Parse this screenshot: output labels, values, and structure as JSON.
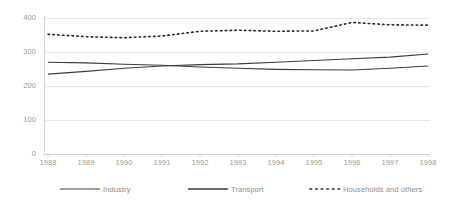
{
  "chart_data": {
    "type": "line",
    "title": "",
    "xlabel": "",
    "ylabel": "",
    "categories": [
      "1988",
      "1989",
      "1990",
      "1991",
      "1992",
      "1993",
      "1994",
      "1995",
      "1996",
      "1997",
      "1998"
    ],
    "x": [
      1988,
      1989,
      1990,
      1991,
      1992,
      1993,
      1994,
      1995,
      1996,
      1997,
      1998
    ],
    "ylim": [
      0,
      400
    ],
    "yticks": [
      0,
      100,
      200,
      300,
      400
    ],
    "grid": "horizontal",
    "legend_position": "bottom",
    "series": [
      {
        "name": "Industry",
        "style": "solid",
        "color": "#3c3c3c",
        "values": [
          270,
          268,
          264,
          261,
          256,
          252,
          249,
          248,
          247,
          252,
          259
        ]
      },
      {
        "name": "Transport",
        "style": "solid",
        "color": "#3c3c3c",
        "values": [
          235,
          243,
          252,
          259,
          263,
          265,
          270,
          275,
          280,
          285,
          294
        ]
      },
      {
        "name": "Households and others",
        "style": "dotted",
        "color": "#2b2b2b",
        "values": [
          352,
          345,
          342,
          347,
          361,
          364,
          361,
          362,
          387,
          380,
          379
        ]
      }
    ]
  },
  "axis": {
    "y_labels": [
      "400",
      "300",
      "200",
      "100",
      "0"
    ],
    "x_labels": [
      "1988",
      "1989",
      "1990",
      "1991",
      "1992",
      "1993",
      "1994",
      "1995",
      "1996",
      "1997",
      "1998"
    ]
  },
  "legend": {
    "items": [
      {
        "label": "Industry",
        "marker": "solid-line-swatch"
      },
      {
        "label": "Transport",
        "marker": "solid-line-swatch"
      },
      {
        "label": "Households and others",
        "marker": "dotted-line-swatch"
      }
    ]
  },
  "colors": {
    "grid": "#e3e3e3",
    "axis": "#d6d6d6",
    "tick_text": "#9a9a9a",
    "legend_text": "#8c8c8c",
    "series_solid": "#3c3c3c",
    "series_dotted": "#2b2b2b",
    "background": "#ffffff"
  }
}
